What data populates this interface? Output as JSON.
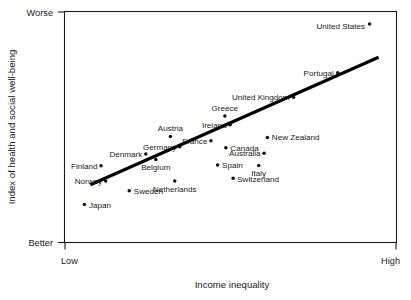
{
  "chart_data": {
    "type": "scatter",
    "title": "",
    "xlabel": "Income inequality",
    "ylabel": "Index of health and social well-being",
    "x_tick_labels": [
      "Low",
      "High"
    ],
    "y_tick_labels": [
      "Worse",
      "Better"
    ],
    "xlim": [
      0,
      100
    ],
    "ylim": [
      0,
      100
    ],
    "grid": false,
    "legend": "none",
    "annotations": [],
    "trend_line": {
      "label": "regression line",
      "x_start": 7.8,
      "y_start": 25.0,
      "x_end": 94.6,
      "y_end": 80.2
    },
    "points": [
      {
        "label": "Japan",
        "x": 6.0,
        "y": 16.4,
        "label_dx": 4.5,
        "label_dy": 3.0,
        "anchor": "start"
      },
      {
        "label": "Norway",
        "x": 12.4,
        "y": 26.6,
        "label_dx": -3.5,
        "label_dy": 2.9,
        "anchor": "end"
      },
      {
        "label": "Finland",
        "x": 11.0,
        "y": 33.2,
        "label_dx": -3.5,
        "label_dy": 2.9,
        "anchor": "end"
      },
      {
        "label": "Sweden",
        "x": 19.5,
        "y": 22.4,
        "label_dx": 4.5,
        "label_dy": 3.0,
        "anchor": "start"
      },
      {
        "label": "Denmark",
        "x": 24.5,
        "y": 38.3,
        "label_dx": -3.5,
        "label_dy": 2.9,
        "anchor": "end"
      },
      {
        "label": "Belgium",
        "x": 27.5,
        "y": 35.9,
        "label_dx": 0,
        "label_dy": 10.5,
        "anchor": "middle"
      },
      {
        "label": "Netherlands",
        "x": 33.2,
        "y": 26.6,
        "label_dx": 0,
        "label_dy": 11.0,
        "anchor": "middle"
      },
      {
        "label": "Germany",
        "x": 34.7,
        "y": 41.5,
        "label_dx": -3.5,
        "label_dy": 2.9,
        "anchor": "end"
      },
      {
        "label": "Austria",
        "x": 31.9,
        "y": 45.9,
        "label_dx": 0,
        "label_dy": -5.0,
        "anchor": "middle"
      },
      {
        "label": "France",
        "x": 44.1,
        "y": 44.0,
        "label_dx": -3.5,
        "label_dy": 2.9,
        "anchor": "end"
      },
      {
        "label": "Canada",
        "x": 48.6,
        "y": 41.0,
        "label_dx": 4.5,
        "label_dy": 3.0,
        "anchor": "start"
      },
      {
        "label": "Spain",
        "x": 46.1,
        "y": 33.6,
        "label_dx": 4.5,
        "label_dy": 3.0,
        "anchor": "start"
      },
      {
        "label": "Switzerland",
        "x": 50.8,
        "y": 27.8,
        "label_dx": 4.0,
        "label_dy": 3.4,
        "anchor": "start"
      },
      {
        "label": "Italy",
        "x": 58.5,
        "y": 33.3,
        "label_dx": 0,
        "label_dy": 10.5,
        "anchor": "middle"
      },
      {
        "label": "Australia",
        "x": 60.1,
        "y": 38.6,
        "label_dx": -3.5,
        "label_dy": 2.9,
        "anchor": "end"
      },
      {
        "label": "Ireland",
        "x": 49.9,
        "y": 51.0,
        "label_dx": -3.5,
        "label_dy": 2.9,
        "anchor": "end"
      },
      {
        "label": "Greece",
        "x": 48.3,
        "y": 54.8,
        "label_dx": 0,
        "label_dy": -4.8,
        "anchor": "middle"
      },
      {
        "label": "New Zealand",
        "x": 61.1,
        "y": 45.5,
        "label_dx": 4.5,
        "label_dy": 3.0,
        "anchor": "start"
      },
      {
        "label": "United Kingdom",
        "x": 69.0,
        "y": 62.9,
        "label_dx": -4.0,
        "label_dy": 2.9,
        "anchor": "end"
      },
      {
        "label": "Portugal",
        "x": 82.3,
        "y": 73.5,
        "label_dx": -4.0,
        "label_dy": 2.9,
        "anchor": "end"
      },
      {
        "label": "United States",
        "x": 91.9,
        "y": 94.6,
        "label_dx": -4.5,
        "label_dy": 4.6,
        "anchor": "end"
      }
    ]
  }
}
